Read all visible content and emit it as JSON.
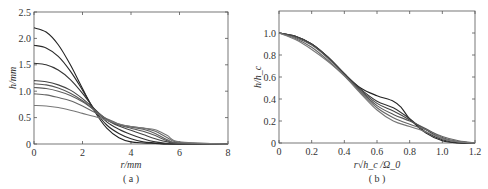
{
  "chart_data": [
    {
      "id": "a",
      "type": "line",
      "caption": "( a )",
      "xlabel": "r/mm",
      "ylabel": "h/mm",
      "xlim": [
        0,
        8
      ],
      "ylim": [
        0,
        2.5
      ],
      "xticks": [
        "0",
        "2",
        "4",
        "6",
        "8"
      ],
      "yticks": [
        "0",
        "0.5",
        "1.0",
        "1.5",
        "2.0",
        "2.5"
      ],
      "grid": false,
      "legend": null,
      "series": [
        {
          "name": "curve1",
          "color": "#222222",
          "x": [
            0,
            0.5,
            1,
            1.5,
            2,
            2.5,
            3,
            3.5,
            4,
            4.5,
            5,
            5.5,
            6,
            8
          ],
          "y": [
            2.2,
            2.12,
            1.88,
            1.5,
            1.05,
            0.62,
            0.3,
            0.12,
            0.04,
            0.02,
            0.01,
            0.0,
            0.0,
            0.0
          ]
        },
        {
          "name": "curve2",
          "color": "#2a2a2a",
          "x": [
            0,
            0.5,
            1,
            1.5,
            2,
            2.5,
            3,
            3.5,
            4,
            4.5,
            5,
            5.5,
            6,
            8
          ],
          "y": [
            1.87,
            1.82,
            1.66,
            1.38,
            1.02,
            0.64,
            0.36,
            0.2,
            0.1,
            0.04,
            0.02,
            0.0,
            0.0,
            0.0
          ]
        },
        {
          "name": "curve3",
          "color": "#333333",
          "x": [
            0,
            0.5,
            1,
            1.5,
            2,
            2.5,
            3,
            3.5,
            4,
            4.5,
            5,
            5.5,
            6,
            8
          ],
          "y": [
            1.53,
            1.5,
            1.4,
            1.22,
            0.96,
            0.66,
            0.42,
            0.28,
            0.18,
            0.1,
            0.04,
            0.01,
            0.0,
            0.0
          ]
        },
        {
          "name": "curve4",
          "color": "#444444",
          "x": [
            0,
            0.5,
            1,
            1.5,
            2,
            2.5,
            3,
            3.5,
            4,
            4.5,
            5,
            5.5,
            6,
            8
          ],
          "y": [
            1.2,
            1.18,
            1.12,
            1.02,
            0.86,
            0.66,
            0.46,
            0.34,
            0.26,
            0.18,
            0.1,
            0.04,
            0.01,
            0.0
          ]
        },
        {
          "name": "curve5",
          "color": "#555555",
          "x": [
            0,
            0.5,
            1,
            1.5,
            2,
            2.5,
            3,
            3.5,
            4,
            4.5,
            5,
            5.5,
            6,
            8
          ],
          "y": [
            1.14,
            1.12,
            1.06,
            0.96,
            0.82,
            0.64,
            0.46,
            0.36,
            0.3,
            0.24,
            0.16,
            0.06,
            0.01,
            0.0
          ]
        },
        {
          "name": "curve6",
          "color": "#5e5e5e",
          "x": [
            0,
            0.5,
            1,
            1.5,
            2,
            2.5,
            3,
            3.5,
            4,
            4.5,
            5,
            5.5,
            6,
            8
          ],
          "y": [
            1.07,
            1.05,
            1.0,
            0.92,
            0.8,
            0.64,
            0.47,
            0.37,
            0.32,
            0.28,
            0.2,
            0.08,
            0.02,
            0.0
          ]
        },
        {
          "name": "curve7",
          "color": "#666666",
          "x": [
            0,
            0.5,
            1,
            1.5,
            2,
            2.5,
            3,
            3.5,
            4,
            4.5,
            5,
            5.5,
            6,
            8
          ],
          "y": [
            0.95,
            0.93,
            0.88,
            0.82,
            0.72,
            0.6,
            0.48,
            0.38,
            0.33,
            0.3,
            0.24,
            0.12,
            0.03,
            0.0
          ]
        },
        {
          "name": "curve8",
          "color": "#777777",
          "x": [
            0,
            0.5,
            1,
            1.5,
            2,
            2.5,
            3,
            3.5,
            4,
            4.5,
            5,
            5.5,
            6,
            8
          ],
          "y": [
            0.73,
            0.72,
            0.69,
            0.64,
            0.58,
            0.52,
            0.45,
            0.38,
            0.33,
            0.3,
            0.27,
            0.16,
            0.04,
            0.0
          ]
        }
      ]
    },
    {
      "id": "b",
      "type": "line",
      "caption": "( b )",
      "xlabel": "r√h_c /Ω_0",
      "ylabel": "h/h_c",
      "xlim": [
        0,
        1.2
      ],
      "ylim": [
        0,
        1.2
      ],
      "xticks": [
        "0",
        "0.2",
        "0.4",
        "0.6",
        "0.8",
        "1.0",
        "1.2"
      ],
      "yticks": [
        "0",
        "0.2",
        "0.4",
        "0.6",
        "0.8",
        "1.0"
      ],
      "grid": false,
      "legend": null,
      "series": [
        {
          "name": "curve1",
          "color": "#222222",
          "x": [
            0,
            0.1,
            0.2,
            0.3,
            0.4,
            0.5,
            0.6,
            0.7,
            0.75,
            0.8,
            0.9,
            1.0,
            1.1,
            1.2
          ],
          "y": [
            1.0,
            0.97,
            0.9,
            0.78,
            0.63,
            0.5,
            0.43,
            0.38,
            0.32,
            0.22,
            0.09,
            0.02,
            0.0,
            0.0
          ]
        },
        {
          "name": "curve2",
          "color": "#333333",
          "x": [
            0,
            0.1,
            0.2,
            0.3,
            0.4,
            0.5,
            0.6,
            0.7,
            0.8,
            0.9,
            1.0,
            1.1,
            1.2
          ],
          "y": [
            1.0,
            0.97,
            0.9,
            0.78,
            0.63,
            0.49,
            0.38,
            0.32,
            0.22,
            0.1,
            0.03,
            0.0,
            0.0
          ]
        },
        {
          "name": "curve3",
          "color": "#444444",
          "x": [
            0,
            0.1,
            0.2,
            0.3,
            0.4,
            0.5,
            0.6,
            0.7,
            0.8,
            0.9,
            1.0,
            1.1,
            1.2
          ],
          "y": [
            1.0,
            0.97,
            0.9,
            0.78,
            0.63,
            0.48,
            0.36,
            0.29,
            0.21,
            0.12,
            0.04,
            0.01,
            0.0
          ]
        },
        {
          "name": "curve4",
          "color": "#555555",
          "x": [
            0,
            0.1,
            0.2,
            0.3,
            0.4,
            0.5,
            0.6,
            0.7,
            0.8,
            0.9,
            1.0,
            1.1,
            1.2
          ],
          "y": [
            1.0,
            0.96,
            0.89,
            0.77,
            0.62,
            0.47,
            0.34,
            0.26,
            0.2,
            0.13,
            0.05,
            0.01,
            0.0
          ]
        },
        {
          "name": "curve5",
          "color": "#666666",
          "x": [
            0,
            0.1,
            0.2,
            0.3,
            0.4,
            0.5,
            0.6,
            0.7,
            0.8,
            0.9,
            1.0,
            1.1,
            1.2
          ],
          "y": [
            1.0,
            0.95,
            0.87,
            0.75,
            0.61,
            0.46,
            0.32,
            0.23,
            0.17,
            0.12,
            0.06,
            0.02,
            0.0
          ]
        },
        {
          "name": "curve6",
          "color": "#777777",
          "x": [
            0,
            0.1,
            0.2,
            0.3,
            0.4,
            0.5,
            0.6,
            0.7,
            0.8,
            0.9,
            1.0,
            1.1,
            1.2
          ],
          "y": [
            1.0,
            0.94,
            0.85,
            0.74,
            0.61,
            0.45,
            0.3,
            0.2,
            0.15,
            0.1,
            0.04,
            0.01,
            0.0
          ]
        }
      ]
    }
  ]
}
